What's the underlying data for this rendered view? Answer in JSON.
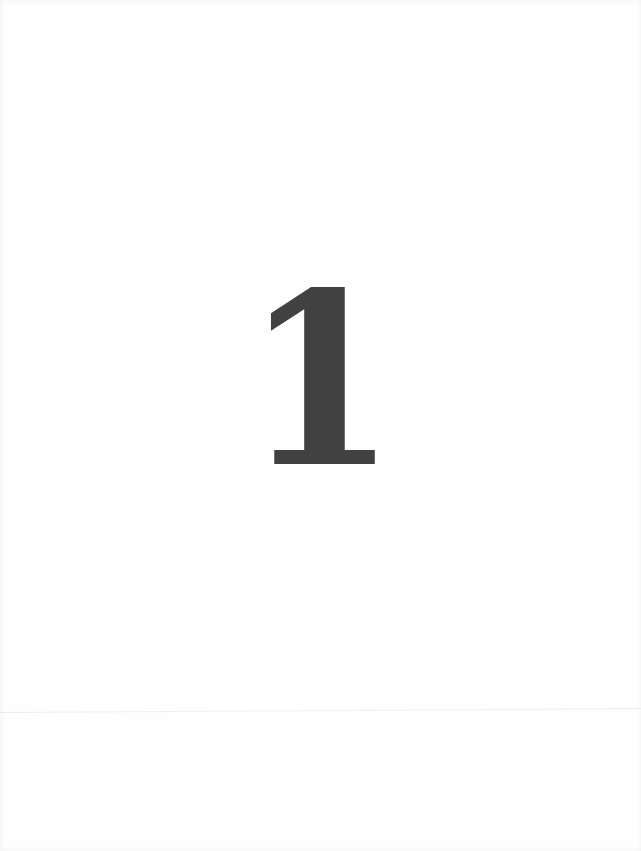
{
  "page": {
    "chapter_number": "1",
    "colors": {
      "background": "#fefefe",
      "numeral": "#414141",
      "fold_line": "#ececec"
    }
  }
}
